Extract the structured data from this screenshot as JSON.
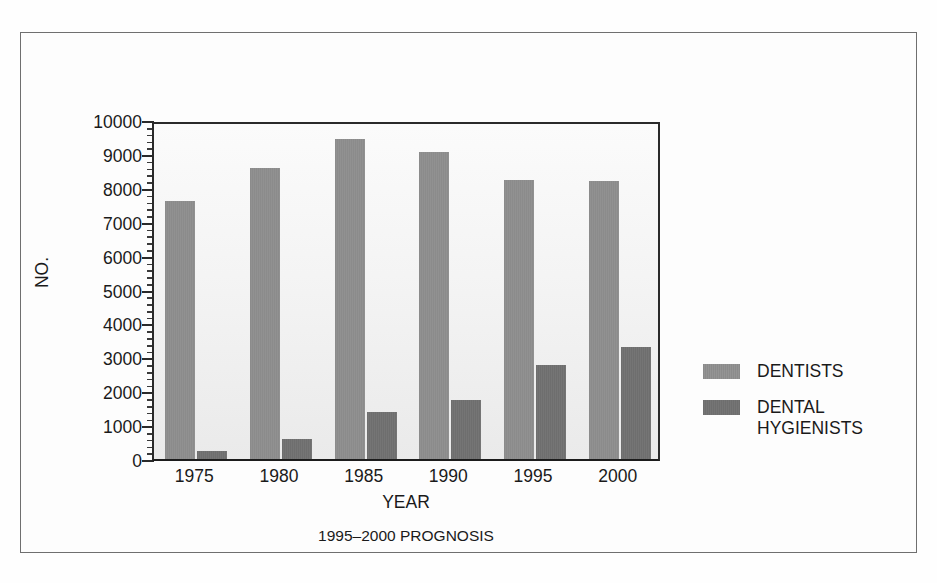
{
  "chart_data": {
    "type": "bar",
    "title": "",
    "caption": "1995–2000 PROGNOSIS",
    "xlabel": "YEAR",
    "ylabel": "NO.",
    "categories": [
      "1975",
      "1980",
      "1985",
      "1990",
      "1995",
      "2000"
    ],
    "series": [
      {
        "name": "DENTISTS",
        "color": "#8b8b8b",
        "values": [
          7600,
          8580,
          9450,
          9050,
          8230,
          8200
        ]
      },
      {
        "name": "DENTAL\nHYGIENISTS",
        "color": "#6e6e6e",
        "values": [
          250,
          600,
          1390,
          1740,
          2760,
          3300
        ]
      }
    ],
    "ylim": [
      0,
      10000
    ],
    "ytick_labels": [
      "10000",
      "9000",
      "8000",
      "7000",
      "6000",
      "5000",
      "4000",
      "3000",
      "2000",
      "1000",
      "0"
    ],
    "ytick_values": [
      10000,
      9000,
      8000,
      7000,
      6000,
      5000,
      4000,
      3000,
      2000,
      1000,
      0
    ],
    "minor_ticks_per_interval": 4,
    "grid": false,
    "legend_position": "right"
  },
  "legend": {
    "entries": [
      {
        "label": "DENTISTS"
      },
      {
        "label": "DENTAL\nHYGIENISTS"
      }
    ]
  }
}
